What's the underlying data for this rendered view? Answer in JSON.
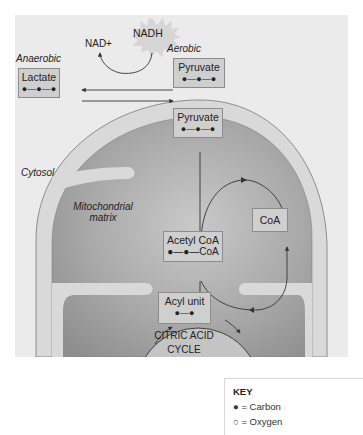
{
  "diagram": {
    "nadh_label": "NADH",
    "nad_label": "NAD+",
    "anaerobic_label": "Anaerobic",
    "aerobic_label": "Aerobic",
    "cytosol_label": "Cytosol",
    "matrix_label_line1": "Mitochondrial",
    "matrix_label_line2": "matrix",
    "boxes": {
      "lactate": {
        "name": "Lactate",
        "chain": "●—●—●"
      },
      "pyruvate_cytosol": {
        "name": "Pyruvate",
        "chain": "●—●—●"
      },
      "pyruvate_mito": {
        "name": "Pyruvate",
        "chain": "●—●—●"
      },
      "coa": {
        "name": "CoA"
      },
      "acetyl_coa": {
        "name": "Acetyl CoA",
        "chain": "●—●—CoA"
      },
      "acyl_unit": {
        "name": "Acyl unit",
        "chain": "●—●"
      }
    },
    "cycle_line1": "CITRIC ACID",
    "cycle_line2": "CYCLE"
  },
  "key": {
    "title": "KEY",
    "items": [
      {
        "symbol": "●",
        "label": "= Carbon"
      },
      {
        "symbol": "○",
        "label": "= Oxygen"
      }
    ]
  },
  "colors": {
    "panel_bg": "#ebebeb",
    "membrane": "#d9d9d9",
    "matrix": "#9c9c9c",
    "box_fill": "#cfcfcf",
    "box_border": "#8c8c8c"
  }
}
